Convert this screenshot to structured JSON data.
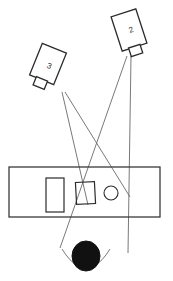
{
  "diagram": {
    "type": "line-drawing",
    "background_color": "#ffffff",
    "line_color": "#4a4a4a",
    "line_color_dark": "#2b2b2b",
    "fill_color": "#111111",
    "cameras": [
      {
        "id": "camera-2",
        "label": "2",
        "body": {
          "x": 116,
          "y": 12,
          "width": 26,
          "height": 36,
          "rotation": -18
        },
        "lens": {
          "x": 124,
          "y": 46,
          "width": 12,
          "height": 9,
          "rotation": -18
        },
        "label_x": 131,
        "label_y": 32
      },
      {
        "id": "camera-3",
        "label": "3",
        "body": {
          "x": 35,
          "y": 47,
          "width": 26,
          "height": 34,
          "rotation": 22
        },
        "lens": {
          "x": 56,
          "y": 81,
          "width": 12,
          "height": 9,
          "rotation": 22
        },
        "label_x": 50,
        "label_y": 68
      }
    ],
    "sight_lines": [
      {
        "name": "camera-2-ray-left",
        "x1": 127,
        "y1": 56,
        "x2": 60,
        "y2": 248
      },
      {
        "name": "camera-2-ray-right",
        "x1": 131,
        "y1": 56,
        "x2": 128,
        "y2": 253
      },
      {
        "name": "camera-3-ray-left",
        "x1": 62,
        "y1": 92,
        "x2": 88,
        "y2": 205
      },
      {
        "name": "camera-3-ray-right",
        "x1": 65,
        "y1": 92,
        "x2": 130,
        "y2": 197
      }
    ],
    "table": {
      "name": "table-platform",
      "x": 9,
      "y": 167,
      "width": 151,
      "height": 50
    },
    "objects": [
      {
        "name": "object-rect-large",
        "shape": "rect",
        "x": 46,
        "y": 178,
        "width": 18,
        "height": 34,
        "rotation": 0
      },
      {
        "name": "object-rect-small",
        "shape": "rect",
        "x": 76,
        "y": 182,
        "width": 19,
        "height": 22,
        "rotation": -3
      },
      {
        "name": "object-circle",
        "shape": "circle",
        "cx": 111,
        "cy": 193,
        "r": 7
      }
    ],
    "person": {
      "name": "person-head",
      "cx": 86,
      "cy": 256,
      "rx": 14,
      "ry": 15,
      "shoulder_left": "M 62 249 Q 70 262 78 266",
      "shoulder_right": "M 110 249 Q 102 262 94 266"
    }
  }
}
